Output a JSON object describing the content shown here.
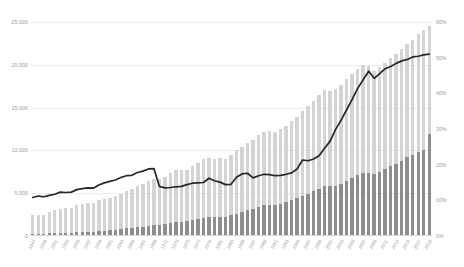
{
  "chart_data": {
    "type": "bar",
    "title": "",
    "subtitle": "",
    "xlabel": "",
    "ylabel": "",
    "y2label": "",
    "grid": true,
    "legend_position": "none",
    "ylim": [
      0,
      25000
    ],
    "y2lim": [
      0,
      60
    ],
    "yticks": [
      "0",
      "5,000",
      "10,000",
      "15,000",
      "20,000",
      "25,000"
    ],
    "ytick_values": [
      0,
      5000,
      10000,
      15000,
      20000,
      25000
    ],
    "y2ticks": [
      "0%",
      "10%",
      "20%",
      "30%",
      "40%",
      "50%",
      "60%"
    ],
    "y2tick_values": [
      0,
      10,
      20,
      30,
      40,
      50,
      60
    ],
    "categories": [
      "1947",
      "1948",
      "1949",
      "1950",
      "1951",
      "1952",
      "1953",
      "1954",
      "1955",
      "1956",
      "1957",
      "1958",
      "1959",
      "1960",
      "1961",
      "1962",
      "1963",
      "1964",
      "1965",
      "1966",
      "1967",
      "1968",
      "1969",
      "1970",
      "1971",
      "1972",
      "1973",
      "1974",
      "1975",
      "1976",
      "1977",
      "1978",
      "1979",
      "1980",
      "1981",
      "1982",
      "1983",
      "1984",
      "1985",
      "1986",
      "1987",
      "1988",
      "1989",
      "1990",
      "1991",
      "1992",
      "1993",
      "1994",
      "1995",
      "1996",
      "1997",
      "1998",
      "1999",
      "2000",
      "2001",
      "2002",
      "2003",
      "2004",
      "2005",
      "2006",
      "2007",
      "2008",
      "2009",
      "2010",
      "2011",
      "2012",
      "2013",
      "2014",
      "2015",
      "2016",
      "2017",
      "2018",
      "2019"
    ],
    "xtick_labels": [
      "1947",
      "1949",
      "1951",
      "1953",
      "1955",
      "1957",
      "1959",
      "1961",
      "1963",
      "1965",
      "1967",
      "1969",
      "1971",
      "1973",
      "1975",
      "1977",
      "1979",
      "1981",
      "1983",
      "1985",
      "1987",
      "1989",
      "1991",
      "1993",
      "1995",
      "1997",
      "1999",
      "2001",
      "2003",
      "2005",
      "2007",
      "2009",
      "2011",
      "2013",
      "2015",
      "2017",
      "2019"
    ],
    "series": [
      {
        "name": "Total",
        "type": "bar",
        "axis": "left",
        "color": "#d4d4d4",
        "values": [
          2400,
          2500,
          2450,
          2800,
          3000,
          3100,
          3300,
          3250,
          3600,
          3750,
          3850,
          3800,
          4200,
          4300,
          4450,
          4700,
          4950,
          5250,
          5550,
          5900,
          6050,
          6400,
          6700,
          6700,
          6950,
          7350,
          7750,
          7700,
          7750,
          8150,
          8550,
          8950,
          9150,
          9050,
          9150,
          9050,
          9450,
          10050,
          10450,
          10850,
          11250,
          11750,
          12150,
          12250,
          12150,
          12450,
          12850,
          13450,
          13950,
          14550,
          15150,
          15750,
          16450,
          17050,
          16950,
          17150,
          17650,
          18350,
          18950,
          19550,
          19950,
          19850,
          19250,
          19750,
          20250,
          20750,
          21250,
          21850,
          22450,
          22950,
          23550,
          24050,
          24550
        ]
      },
      {
        "name": "Subset",
        "type": "bar",
        "axis": "left",
        "color": "#8d8d8d",
        "values": [
          260,
          280,
          270,
          320,
          350,
          380,
          400,
          400,
          470,
          500,
          520,
          510,
          600,
          640,
          680,
          740,
          810,
          890,
          960,
          1050,
          1100,
          1200,
          1300,
          1300,
          1400,
          1530,
          1660,
          1660,
          1700,
          1840,
          1990,
          2140,
          2230,
          2210,
          2260,
          2250,
          2410,
          2630,
          2810,
          3000,
          3190,
          3400,
          3580,
          3640,
          3610,
          3740,
          3930,
          4200,
          4420,
          4680,
          4940,
          5220,
          5530,
          5830,
          5810,
          5900,
          6130,
          6480,
          6800,
          7150,
          7390,
          7390,
          7190,
          7510,
          7810,
          8130,
          8430,
          8770,
          9180,
          9460,
          9810,
          10100,
          11950
        ]
      },
      {
        "name": "Share",
        "type": "line",
        "axis": "right",
        "color": "#272727",
        "values": [
          10.8,
          11.2,
          11.0,
          11.4,
          11.7,
          12.3,
          12.2,
          12.3,
          13.0,
          13.3,
          13.5,
          13.4,
          14.3,
          14.9,
          15.3,
          15.7,
          16.4,
          16.9,
          17.0,
          17.8,
          18.2,
          18.8,
          18.9,
          13.9,
          13.5,
          13.6,
          13.8,
          13.9,
          14.4,
          14.8,
          14.9,
          15.0,
          16.2,
          15.5,
          15.1,
          14.4,
          14.5,
          16.5,
          17.4,
          17.6,
          16.3,
          16.9,
          17.3,
          17.2,
          16.9,
          17.0,
          17.3,
          17.7,
          18.8,
          21.3,
          21.1,
          21.6,
          22.5,
          24.6,
          26.6,
          29.9,
          32.5,
          35.4,
          38.3,
          41.4,
          43.8,
          46.2,
          44.2,
          45.5,
          46.9,
          47.5,
          48.4,
          49.1,
          49.5,
          50.2,
          50.4,
          50.8,
          51.0
        ]
      }
    ],
    "colors": {
      "bar_total": "#d4d4d4",
      "bar_subset": "#8d8d8d",
      "line": "#272727",
      "grid": "#ececed",
      "axis_text": "#9a9a9a",
      "background": "#ffffff"
    }
  }
}
